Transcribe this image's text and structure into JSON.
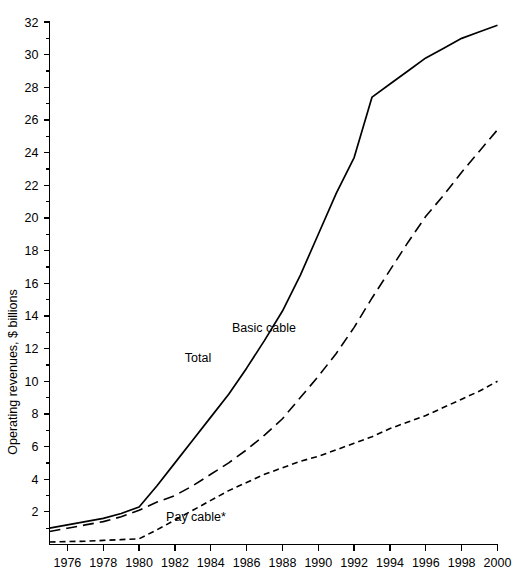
{
  "chart_data": {
    "type": "line",
    "title": "",
    "xlabel": "",
    "ylabel": "Operating revenues, $ billions",
    "xlim": [
      1975,
      2000
    ],
    "ylim": [
      0,
      32
    ],
    "grid": false,
    "legend_position": "inline-annotations",
    "x_tick_labels": [
      "1976",
      "1978",
      "1980",
      "1982",
      "1984",
      "1986",
      "1988",
      "1990",
      "1992",
      "1994",
      "1996",
      "1998",
      "2000"
    ],
    "x_ticks": [
      1976,
      1978,
      1980,
      1982,
      1984,
      1986,
      1988,
      1990,
      1992,
      1994,
      1996,
      1998,
      2000
    ],
    "y_tick_labels": [
      "2",
      "4",
      "6",
      "8",
      "10",
      "12",
      "14",
      "16",
      "18",
      "20",
      "22",
      "24",
      "26",
      "28",
      "30",
      "32"
    ],
    "y_ticks": [
      2,
      4,
      6,
      8,
      10,
      12,
      14,
      16,
      18,
      20,
      22,
      24,
      26,
      28,
      30,
      32
    ],
    "y_minor_ticks": [
      1,
      3,
      5,
      7,
      9,
      11,
      13,
      15,
      17,
      19,
      21,
      23,
      25,
      27,
      29,
      31
    ],
    "x": [
      1975,
      1976,
      1977,
      1978,
      1979,
      1980,
      1981,
      1982,
      1983,
      1984,
      1985,
      1986,
      1987,
      1988,
      1989,
      1990,
      1991,
      1992,
      1993,
      1994,
      1995,
      1996,
      1997,
      1998,
      1999,
      2000
    ],
    "series": [
      {
        "name": "Total",
        "label": "Total",
        "style": "solid",
        "dash": "none",
        "color": "#000000",
        "values": [
          1.0,
          1.2,
          1.4,
          1.6,
          1.9,
          2.3,
          3.6,
          5.0,
          6.4,
          7.8,
          9.2,
          10.8,
          12.5,
          14.3,
          16.5,
          19.0,
          21.5,
          23.7,
          27.4,
          28.2,
          29.0,
          29.8,
          30.4,
          31.0,
          31.4,
          31.8
        ]
      },
      {
        "name": "Basic cable",
        "label": "Basic cable",
        "style": "dashed-long",
        "dash": "11,6",
        "color": "#000000",
        "values": [
          0.8,
          1.0,
          1.2,
          1.4,
          1.7,
          2.1,
          2.6,
          3.0,
          3.6,
          4.3,
          5.0,
          5.8,
          6.7,
          7.7,
          9.0,
          10.3,
          11.7,
          13.3,
          15.1,
          16.8,
          18.5,
          20.1,
          21.4,
          22.8,
          24.1,
          25.4
        ]
      },
      {
        "name": "Pay cable*",
        "label": "Pay cable*",
        "style": "dashed-short",
        "dash": "6,4",
        "color": "#000000",
        "values": [
          0.15,
          0.18,
          0.2,
          0.25,
          0.3,
          0.35,
          0.9,
          1.5,
          2.1,
          2.7,
          3.3,
          3.8,
          4.3,
          4.7,
          5.1,
          5.4,
          5.8,
          6.2,
          6.6,
          7.1,
          7.5,
          7.9,
          8.4,
          8.9,
          9.4,
          10.0
        ]
      }
    ],
    "annotations": [
      {
        "text": "Total",
        "x_px": 198,
        "y_px": 362
      },
      {
        "text": "Basic cable",
        "x_px": 264,
        "y_px": 332
      },
      {
        "text": "Pay cable*",
        "x_px": 196,
        "y_px": 521
      }
    ]
  }
}
